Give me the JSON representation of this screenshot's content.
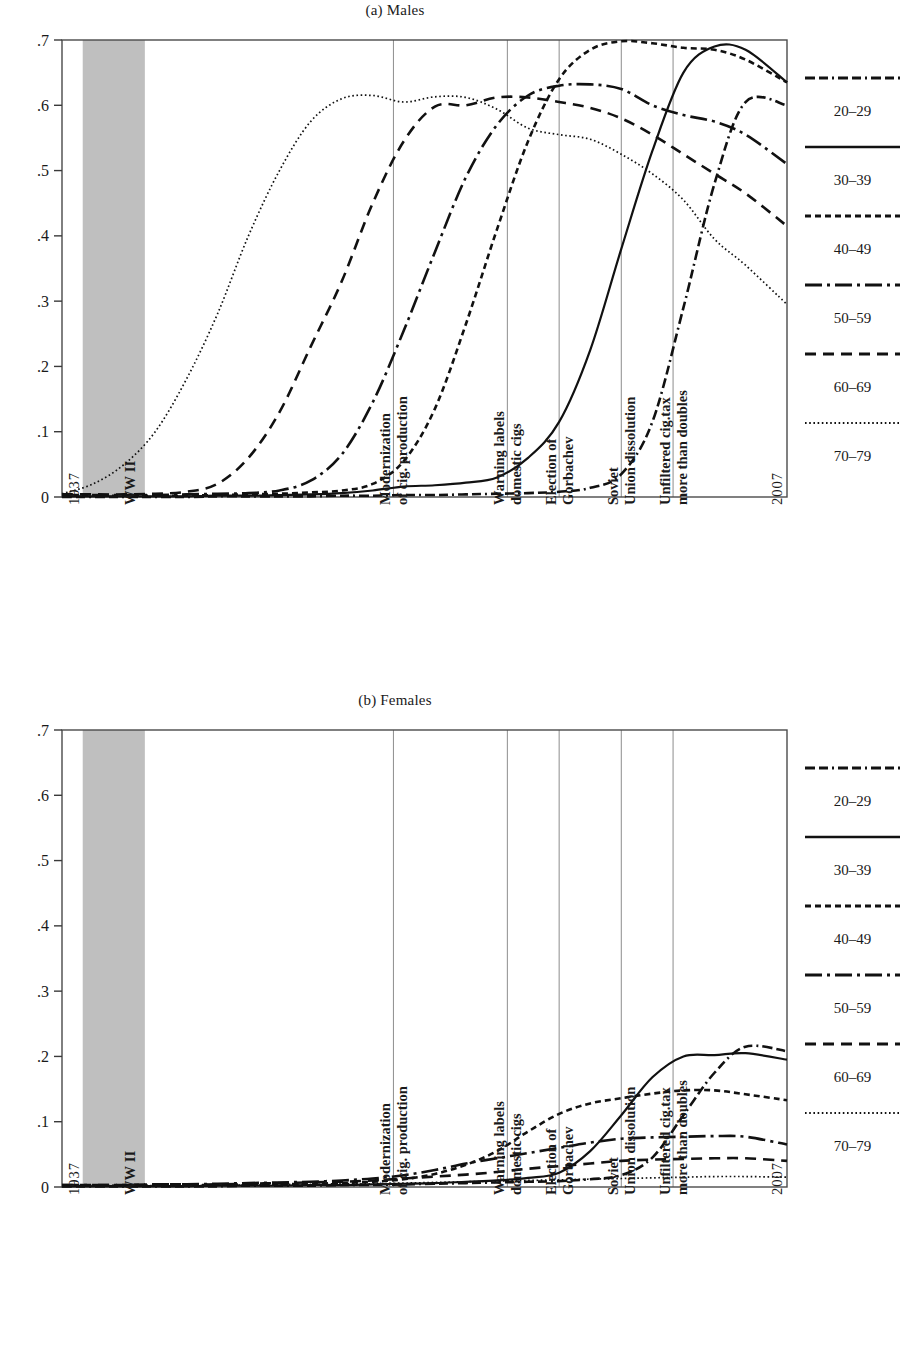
{
  "figure": {
    "panels": [
      {
        "id": "males",
        "title": "(a) Males"
      },
      {
        "id": "females",
        "title": "(b) Females"
      }
    ]
  },
  "axis": {
    "y_ticks": [
      "0",
      ".1",
      ".2",
      ".3",
      ".4",
      ".5",
      ".6",
      ".7"
    ],
    "y_min": 0,
    "y_max": 0.7,
    "x_start_label": "1937",
    "x_end_label": "2007",
    "x_min": 1937,
    "x_max": 2007
  },
  "shading": {
    "label": "WW II",
    "start": 1939,
    "end": 1945,
    "color": "#bfbfbf"
  },
  "events": [
    {
      "year": 1969,
      "lines": [
        "Modernization",
        "of cig. production"
      ]
    },
    {
      "year": 1980,
      "lines": [
        "Warning labels",
        "domestic cigs"
      ]
    },
    {
      "year": 1985,
      "lines": [
        "Election of",
        "Gorbachev"
      ]
    },
    {
      "year": 1991,
      "lines": [
        "Soviet",
        "Union dissolution"
      ]
    },
    {
      "year": 1996,
      "lines": [
        "Unfiltered cig.tax",
        "more than doubles"
      ]
    }
  ],
  "legend": {
    "entries": [
      {
        "label": "20–29",
        "style": "dash-dot-dot"
      },
      {
        "label": "30–39",
        "style": "solid"
      },
      {
        "label": "40–49",
        "style": "dotted-dash"
      },
      {
        "label": "50–59",
        "style": "dash-dot"
      },
      {
        "label": "60–69",
        "style": "dashed"
      },
      {
        "label": "70–79",
        "style": "fine-dotted"
      }
    ]
  },
  "chart_data": {
    "type": "line",
    "xlabel": "",
    "ylabel": "",
    "xlim": [
      1937,
      2007
    ],
    "ylim": [
      0,
      0.7
    ],
    "grid": "vertical-event-lines",
    "legend_position": "right",
    "x": [
      1937,
      1940,
      1943,
      1946,
      1949,
      1952,
      1955,
      1958,
      1961,
      1964,
      1967,
      1970,
      1973,
      1976,
      1979,
      1982,
      1985,
      1988,
      1991,
      1994,
      1997,
      2000,
      2003,
      2007
    ],
    "panels": [
      {
        "name": "(a) Males",
        "series": [
          {
            "name": "70–79",
            "style": "fine-dotted",
            "values": [
              0.005,
              0.02,
              0.05,
              0.1,
              0.18,
              0.28,
              0.4,
              0.5,
              0.575,
              0.61,
              0.615,
              0.605,
              0.613,
              0.612,
              0.594,
              0.565,
              0.555,
              0.548,
              0.525,
              0.495,
              0.455,
              0.395,
              0.355,
              0.295
            ]
          },
          {
            "name": "60–69",
            "style": "dashed",
            "values": [
              0.004,
              0.004,
              0.004,
              0.005,
              0.008,
              0.02,
              0.06,
              0.13,
              0.23,
              0.33,
              0.45,
              0.545,
              0.598,
              0.6,
              0.612,
              0.612,
              0.605,
              0.596,
              0.58,
              0.555,
              0.525,
              0.495,
              0.465,
              0.415
            ]
          },
          {
            "name": "50–59",
            "style": "dash-dot",
            "values": [
              0.003,
              0.003,
              0.003,
              0.003,
              0.004,
              0.005,
              0.006,
              0.01,
              0.025,
              0.065,
              0.145,
              0.255,
              0.375,
              0.49,
              0.57,
              0.615,
              0.63,
              0.632,
              0.625,
              0.6,
              0.585,
              0.575,
              0.555,
              0.51
            ]
          },
          {
            "name": "40–49",
            "style": "dotted-dash",
            "values": [
              0.002,
              0.002,
              0.002,
              0.002,
              0.002,
              0.003,
              0.004,
              0.005,
              0.007,
              0.01,
              0.02,
              0.055,
              0.135,
              0.265,
              0.41,
              0.545,
              0.64,
              0.685,
              0.698,
              0.695,
              0.688,
              0.685,
              0.67,
              0.635
            ]
          },
          {
            "name": "30–39",
            "style": "solid",
            "values": [
              0.001,
              0.001,
              0.001,
              0.001,
              0.001,
              0.002,
              0.002,
              0.003,
              0.004,
              0.006,
              0.01,
              0.016,
              0.018,
              0.022,
              0.03,
              0.06,
              0.115,
              0.225,
              0.38,
              0.53,
              0.65,
              0.69,
              0.685,
              0.635
            ]
          },
          {
            "name": "20–29",
            "style": "dash-dot-dot",
            "values": [
              0.0,
              0.0,
              0.0,
              0.0,
              0.0,
              0.001,
              0.001,
              0.001,
              0.001,
              0.002,
              0.002,
              0.003,
              0.003,
              0.004,
              0.005,
              0.006,
              0.008,
              0.014,
              0.035,
              0.115,
              0.29,
              0.48,
              0.605,
              0.6
            ]
          }
        ]
      },
      {
        "name": "(b) Females",
        "series": [
          {
            "name": "70–79",
            "style": "fine-dotted",
            "values": [
              0.002,
              0.002,
              0.002,
              0.002,
              0.002,
              0.003,
              0.003,
              0.004,
              0.004,
              0.005,
              0.005,
              0.006,
              0.007,
              0.008,
              0.009,
              0.01,
              0.011,
              0.012,
              0.013,
              0.014,
              0.015,
              0.016,
              0.016,
              0.015
            ]
          },
          {
            "name": "60–69",
            "style": "dashed",
            "values": [
              0.003,
              0.003,
              0.003,
              0.004,
              0.004,
              0.004,
              0.005,
              0.006,
              0.007,
              0.008,
              0.01,
              0.013,
              0.016,
              0.019,
              0.023,
              0.028,
              0.032,
              0.036,
              0.04,
              0.042,
              0.043,
              0.044,
              0.044,
              0.04
            ]
          },
          {
            "name": "50–59",
            "style": "dash-dot",
            "values": [
              0.003,
              0.003,
              0.003,
              0.004,
              0.004,
              0.005,
              0.006,
              0.007,
              0.008,
              0.01,
              0.013,
              0.018,
              0.026,
              0.036,
              0.044,
              0.052,
              0.06,
              0.068,
              0.074,
              0.076,
              0.077,
              0.078,
              0.077,
              0.065
            ]
          },
          {
            "name": "40–49",
            "style": "dotted-dash",
            "values": [
              0.002,
              0.002,
              0.002,
              0.002,
              0.003,
              0.003,
              0.004,
              0.004,
              0.005,
              0.006,
              0.008,
              0.012,
              0.02,
              0.034,
              0.055,
              0.085,
              0.112,
              0.128,
              0.136,
              0.143,
              0.148,
              0.148,
              0.142,
              0.133
            ]
          },
          {
            "name": "30–39",
            "style": "solid",
            "values": [
              0.001,
              0.001,
              0.001,
              0.001,
              0.001,
              0.002,
              0.002,
              0.002,
              0.003,
              0.003,
              0.004,
              0.005,
              0.006,
              0.008,
              0.01,
              0.014,
              0.022,
              0.055,
              0.11,
              0.168,
              0.2,
              0.202,
              0.205,
              0.195
            ]
          },
          {
            "name": "20–29",
            "style": "dash-dot-dot",
            "values": [
              0.001,
              0.001,
              0.001,
              0.001,
              0.001,
              0.001,
              0.002,
              0.002,
              0.002,
              0.003,
              0.003,
              0.004,
              0.005,
              0.006,
              0.007,
              0.008,
              0.009,
              0.012,
              0.018,
              0.045,
              0.11,
              0.175,
              0.215,
              0.208
            ]
          }
        ]
      }
    ]
  }
}
